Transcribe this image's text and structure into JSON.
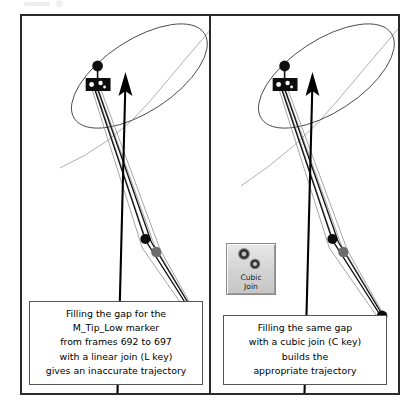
{
  "figure": {
    "type": "two-panel-comparison",
    "panels": [
      {
        "id": "left",
        "name": "linear-join-panel",
        "caption": {
          "lines": [
            "Filling the gap for the",
            "M_Tip_Low marker",
            "from frames 692 to 697",
            "with a linear join (L key)",
            "gives an inaccurate trajectory"
          ]
        },
        "scene": {
          "marker_label": "M_Tip_Low",
          "selection_ellipse": "marker-selection-ellipse",
          "direction_arrow": "trajectory-direction-arrow",
          "trajectory_type": "linear",
          "frames_from": 692,
          "frames_to": 697,
          "hotkey": "L"
        }
      },
      {
        "id": "right",
        "name": "cubic-join-panel",
        "caption": {
          "lines": [
            "Filling the same gap",
            "with a cubic join (C key)",
            "builds the",
            "appropriate trajectory"
          ]
        },
        "scene": {
          "marker_label": "M_Tip_Low",
          "selection_ellipse": "marker-selection-ellipse",
          "direction_arrow": "trajectory-direction-arrow",
          "trajectory_type": "cubic",
          "hotkey": "C"
        },
        "toolbar_button": {
          "name": "cubic-join-button",
          "label_lines": [
            "Cubic",
            "Join"
          ],
          "icon": "cubic-join-icon"
        }
      }
    ]
  },
  "colors": {
    "frame_border": "#2b2b2b",
    "caption_border": "#555555",
    "background": "#ffffff",
    "stroke_dark": "#000000",
    "stroke_light": "#8f8f8f",
    "button_face": "#d2d2d2"
  }
}
